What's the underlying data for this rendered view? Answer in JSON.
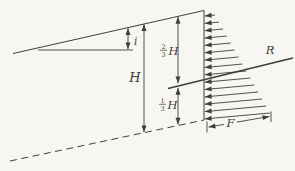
{
  "figure": {
    "background_color": "#f8f6f2",
    "ink_color": "#3f3e3a",
    "pressure_arrow_count": 15
  },
  "labels": {
    "slope_angle": "i",
    "wall_height": "H",
    "upper_segment": {
      "numerator": "2",
      "denominator": "3",
      "symbol": "H"
    },
    "lower_segment": {
      "numerator": "1",
      "denominator": "3",
      "symbol": "H"
    },
    "resultant_force": "R",
    "pressure_base_width": "F"
  }
}
